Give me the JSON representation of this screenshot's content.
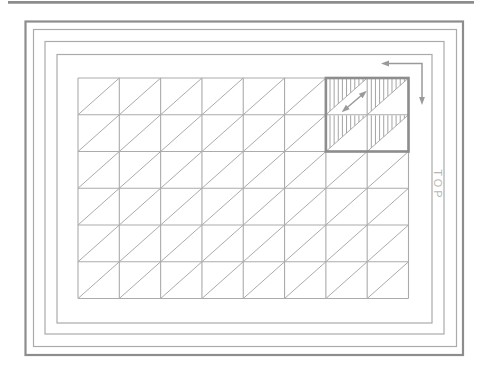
{
  "diagram": {
    "label_top": {
      "text": "TOP"
    },
    "colors": {
      "background": "#ffffff",
      "frame_thick": "#8d8d8d",
      "frame_thin": "#ababab",
      "grid_line": "#ababab",
      "block_border": "#8d8d8d",
      "hatch": "#a4a4a4",
      "arrow": "#9a9a9a",
      "label": "#b6b6b6"
    },
    "frame": {
      "nested_rectangles": 4
    },
    "grid": {
      "columns": 8,
      "rows": 6,
      "diagonal_direction": "bottom-left-to-top-right"
    },
    "highlight_block": {
      "columns": 2,
      "rows": 2,
      "anchor": "top-right-of-grid",
      "hatch_pattern": "vertical-lines-in-upper-left-triangle",
      "hatch_lines_per_cell": 9
    },
    "arrows": {
      "corner_arrow": {
        "shape": "L",
        "heads": [
          "left",
          "down"
        ]
      },
      "diagonal_arrow": {
        "shape": "line",
        "heads": [
          "up-right",
          "down-left"
        ]
      }
    }
  }
}
